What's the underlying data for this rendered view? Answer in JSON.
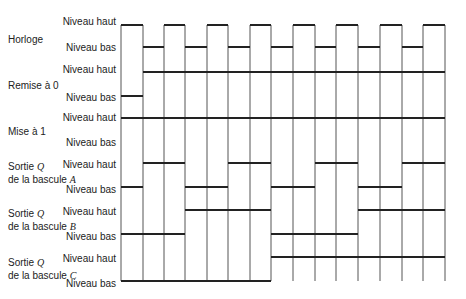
{
  "signals": [
    {
      "name": "Horloge",
      "name_suffix": "",
      "line2": "",
      "high_label": "Niveau haut",
      "low_label": "Niveau bas"
    },
    {
      "name": "Remise à 0",
      "name_suffix": "",
      "line2": "",
      "high_label": "Niveau haut",
      "low_label": "Niveau bas"
    },
    {
      "name": "Mise à 1",
      "name_suffix": "",
      "line2": "",
      "high_label": "Niveau haut",
      "low_label": "Niveau bas"
    },
    {
      "name": "Sortie ",
      "name_suffix": "Q",
      "line2": "de la bascule ",
      "line2_suffix": "A",
      "high_label": "Niveau haut",
      "low_label": "Niveau bas"
    },
    {
      "name": "Sortie ",
      "name_suffix": "Q",
      "line2": "de la bascule ",
      "line2_suffix": "B",
      "high_label": "Niveau haut",
      "low_label": "Niveau bas"
    },
    {
      "name": "Sortie ",
      "name_suffix": "Q",
      "line2": "de la bascule ",
      "line2_suffix": "C",
      "high_label": "Niveau haut",
      "low_label": "Niveau bas"
    }
  ],
  "timing": {
    "edges_x": [
      121,
      143,
      164,
      185,
      207,
      228,
      250,
      271,
      293,
      315,
      336,
      358,
      380,
      402,
      423,
      445
    ],
    "clock": [
      1,
      0,
      1,
      0,
      1,
      0,
      1,
      0,
      1,
      0,
      1,
      0,
      1,
      0,
      1
    ],
    "reset": [
      0,
      1,
      1,
      1,
      1,
      1,
      1,
      1,
      1,
      1,
      1,
      1,
      1,
      1,
      1
    ],
    "set": [
      1,
      1,
      1,
      1,
      1,
      1,
      1,
      1,
      1,
      1,
      1,
      1,
      1,
      1,
      1
    ],
    "q_a": [
      0,
      1,
      1,
      0,
      0,
      1,
      1,
      0,
      0,
      1,
      1,
      0,
      0,
      1,
      1
    ],
    "q_b": [
      0,
      0,
      0,
      1,
      1,
      1,
      1,
      0,
      0,
      0,
      0,
      1,
      1,
      1,
      1
    ],
    "q_c": [
      0,
      0,
      0,
      0,
      0,
      0,
      0,
      1,
      1,
      1,
      1,
      1,
      1,
      1,
      1
    ]
  },
  "colors": {
    "line": "#222222",
    "grid": "#555555"
  }
}
